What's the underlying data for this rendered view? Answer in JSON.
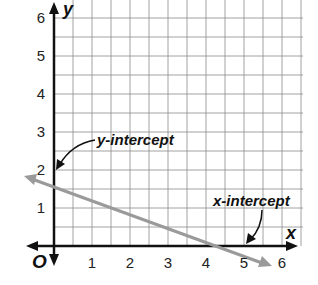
{
  "chart_data": {
    "type": "line",
    "title": "",
    "xlabel": "x",
    "ylabel": "y",
    "origin_label": "O",
    "xlim": [
      0,
      6
    ],
    "ylim": [
      0,
      6
    ],
    "grid": true,
    "grid_step": 0.5,
    "x_ticks": [
      "1",
      "2",
      "3",
      "4",
      "5",
      "6"
    ],
    "y_ticks": [
      "1",
      "2",
      "3",
      "4",
      "5",
      "6"
    ],
    "series": [
      {
        "name": "line",
        "equation": "y = -0.4x + 2",
        "points": [
          [
            0,
            2
          ],
          [
            5,
            0
          ]
        ],
        "color": "#9a9a9a"
      }
    ],
    "annotations": [
      {
        "text": "y-intercept",
        "point": [
          0,
          2
        ]
      },
      {
        "text": "x-intercept",
        "point": [
          5,
          0
        ]
      }
    ]
  },
  "labels": {
    "x_axis": "x",
    "y_axis": "y",
    "origin": "O",
    "y_intercept": "y-intercept",
    "x_intercept": "x-intercept",
    "xt1": "1",
    "xt2": "2",
    "xt3": "3",
    "xt4": "4",
    "xt5": "5",
    "xt6": "6",
    "yt1": "1",
    "yt2": "2",
    "yt3": "3",
    "yt4": "4",
    "yt5": "5",
    "yt6": "6"
  }
}
